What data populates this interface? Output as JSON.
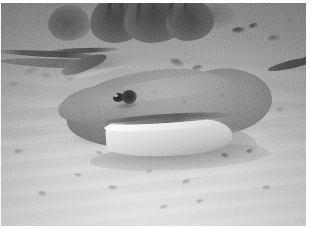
{
  "photo": {
    "title": "Underwater photograph of a stingray on a sandy seabed",
    "medium": "black-and-white photographic print",
    "width_px": 311,
    "height_px": 228,
    "orientation": "landscape",
    "palette": {
      "sand_light": "#d8d8d8",
      "sand_mid": "#b4b4b4",
      "water_haze": "#8e8e8e",
      "ray_body": "#9a9a9a",
      "ray_underside": "#f0f0f0",
      "coral_dark": "#4a4a4a",
      "eye_black": "#262626",
      "print_margin": "#ffffff"
    }
  },
  "scene": {
    "setting": "shallow tropical seafloor",
    "background": "pale rippled sand fading into hazy grey water toward the top",
    "lighting": "diffuse overhead daylight filtering through water"
  },
  "subjects": {
    "stingray": {
      "label": "stingray",
      "description": "a ray resting on the sand, facing left, with a long whip-like tail sweeping up to the right",
      "facing": "left",
      "features": [
        "pointed snout",
        "dark eye",
        "spiracle behind the eye",
        "pale white underside of the near pectoral fin",
        "mottled grey dorsal disc",
        "long slender tail"
      ]
    },
    "background_ray": {
      "label": "second ray tail",
      "description": "a faint dark tail or ridge line crossing the upper-left of the frame"
    },
    "coral": {
      "label": "coral and seagrass clump",
      "description": "dark bushy growth along the top edge of the frame"
    },
    "seabed": {
      "label": "sandy seabed",
      "description": "light rippled sand scattered with small dark pebbles and debris"
    }
  },
  "pebbles": [
    {
      "x": 232,
      "y": 24,
      "w": 13,
      "h": 6,
      "tone": "dark"
    },
    {
      "x": 249,
      "y": 20,
      "w": 9,
      "h": 5,
      "tone": "dark"
    },
    {
      "x": 268,
      "y": 32,
      "w": 12,
      "h": 6,
      "tone": "normal"
    },
    {
      "x": 215,
      "y": 12,
      "w": 8,
      "h": 4,
      "tone": "faint"
    },
    {
      "x": 287,
      "y": 15,
      "w": 10,
      "h": 5,
      "tone": "faint"
    },
    {
      "x": 170,
      "y": 56,
      "w": 14,
      "h": 7,
      "tone": "normal"
    },
    {
      "x": 192,
      "y": 62,
      "w": 11,
      "h": 5,
      "tone": "normal"
    },
    {
      "x": 24,
      "y": 64,
      "w": 16,
      "h": 7,
      "tone": "faint"
    },
    {
      "x": 42,
      "y": 70,
      "w": 10,
      "h": 5,
      "tone": "faint"
    },
    {
      "x": 8,
      "y": 78,
      "w": 12,
      "h": 6,
      "tone": "faint"
    },
    {
      "x": 66,
      "y": 74,
      "w": 9,
      "h": 4,
      "tone": "faint"
    },
    {
      "x": 253,
      "y": 90,
      "w": 11,
      "h": 6,
      "tone": "faint"
    },
    {
      "x": 276,
      "y": 104,
      "w": 9,
      "h": 5,
      "tone": "faint"
    },
    {
      "x": 221,
      "y": 150,
      "w": 8,
      "h": 5,
      "tone": "normal"
    },
    {
      "x": 246,
      "y": 146,
      "w": 7,
      "h": 4,
      "tone": "normal"
    },
    {
      "x": 182,
      "y": 176,
      "w": 9,
      "h": 5,
      "tone": "faint"
    },
    {
      "x": 146,
      "y": 166,
      "w": 7,
      "h": 4,
      "tone": "faint"
    },
    {
      "x": 108,
      "y": 182,
      "w": 10,
      "h": 5,
      "tone": "faint"
    },
    {
      "x": 74,
      "y": 170,
      "w": 8,
      "h": 4,
      "tone": "faint"
    },
    {
      "x": 38,
      "y": 188,
      "w": 9,
      "h": 5,
      "tone": "faint"
    },
    {
      "x": 196,
      "y": 196,
      "w": 8,
      "h": 4,
      "tone": "faint"
    },
    {
      "x": 262,
      "y": 182,
      "w": 9,
      "h": 5,
      "tone": "faint"
    },
    {
      "x": 96,
      "y": 148,
      "w": 7,
      "h": 4,
      "tone": "faint"
    },
    {
      "x": 160,
      "y": 202,
      "w": 8,
      "h": 4,
      "tone": "faint"
    },
    {
      "x": 14,
      "y": 146,
      "w": 9,
      "h": 5,
      "tone": "faint"
    }
  ]
}
